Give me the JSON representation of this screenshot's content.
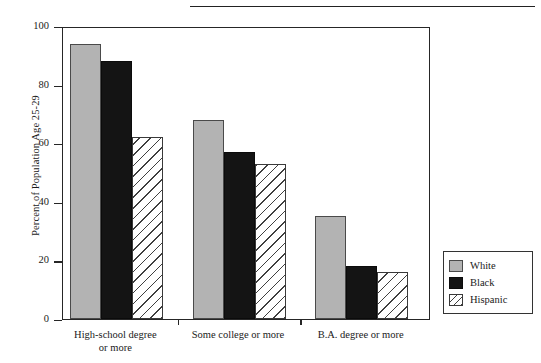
{
  "chart_data": {
    "type": "bar",
    "title": "",
    "xlabel": "",
    "ylabel": "Percent of Population Age 25-29",
    "ylim": [
      0,
      100
    ],
    "yticks": [
      0,
      20,
      40,
      60,
      80,
      100
    ],
    "ytick_labels": [
      "0",
      "20",
      "40",
      "60",
      "80",
      "100"
    ],
    "grid": false,
    "legend_position": "right-bottom-outside",
    "categories": [
      "High-school degree or more",
      "Some college or more",
      "B.A. degree or more"
    ],
    "category_lines": [
      [
        "High-school degree",
        "or more"
      ],
      [
        "Some college or more"
      ],
      [
        "B.A. degree or more"
      ]
    ],
    "series": [
      {
        "name": "White",
        "swatch": "white",
        "color": "#b3b3b3",
        "values": [
          94,
          68,
          35
        ]
      },
      {
        "name": "Black",
        "swatch": "black",
        "color": "#141414",
        "values": [
          88,
          57,
          18
        ]
      },
      {
        "name": "Hispanic",
        "swatch": "hispanic",
        "color": "#ffffff",
        "values": [
          62,
          53,
          16
        ]
      }
    ]
  },
  "legend": {
    "items": [
      {
        "label": "White",
        "swatch": "white"
      },
      {
        "label": "Black",
        "swatch": "black"
      },
      {
        "label": "Hispanic",
        "swatch": "hispanic"
      }
    ]
  }
}
